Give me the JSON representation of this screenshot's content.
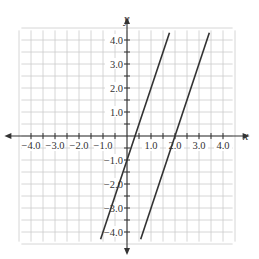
{
  "chart_data": {
    "type": "line",
    "title": "",
    "xlabel": "x",
    "ylabel": "y",
    "xlim": [
      -4.3,
      4.3
    ],
    "ylim": [
      -4.3,
      4.3
    ],
    "grid": true,
    "grid_step": 0.5,
    "x_ticks": [
      "−4.0",
      "−3.0",
      "−2.0",
      "−1.0",
      "1.0",
      "2.0",
      "3.0",
      "4.0"
    ],
    "y_ticks": [
      "4.0",
      "3.0",
      "2.0",
      "1.0",
      "−1.0",
      "−2.0",
      "−3.0",
      "−4.0"
    ],
    "series": [
      {
        "name": "line 1",
        "equation": "y = 3x - 1",
        "slope": 3,
        "intercept": -1,
        "x": [
          -1.1,
          1.77
        ],
        "y": [
          -4.3,
          4.3
        ]
      },
      {
        "name": "line 2",
        "equation": "y = 3x - 6",
        "slope": 3,
        "intercept": -6,
        "x": [
          0.57,
          3.43
        ],
        "y": [
          -4.3,
          4.3
        ]
      }
    ],
    "line_color": "#333333",
    "grid_color": "#cccccc"
  }
}
